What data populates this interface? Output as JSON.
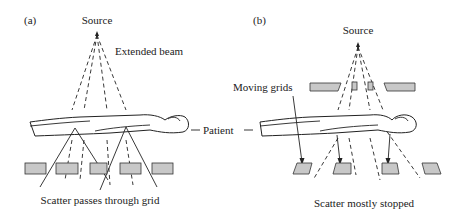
{
  "figure": {
    "panel_a": {
      "label": "(a)",
      "source_label": "Source",
      "beam_label": "Extended beam",
      "caption": "Scatter passes through grid"
    },
    "panel_b": {
      "label": "(b)",
      "source_label": "Source",
      "grids_label": "Moving grids",
      "caption": "Scatter mostly stopped"
    },
    "patient_label": "Patient",
    "colors": {
      "grid_fill": "#c8c8c8",
      "line": "#222222"
    }
  }
}
